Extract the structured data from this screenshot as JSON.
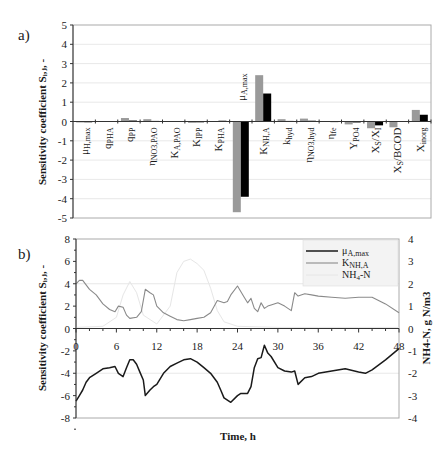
{
  "figure": {
    "panels": [
      "a)",
      "b)"
    ]
  },
  "colors": {
    "gray_bar": "#9a9a9a",
    "black_bar": "#000000",
    "mu_line": "#1a1a1a",
    "k_line": "#8a8a8a",
    "nh4_line": "#e6e6e6",
    "grid": "#d9d9d9",
    "axis": "#333333"
  },
  "chart_data": [
    {
      "type": "bar",
      "panel": "a)",
      "title": "",
      "xlabel": "",
      "ylabel": "Sensitivity coefficient Sᵢ,ⱼ, -",
      "ylim": [
        -5,
        5
      ],
      "yticks": [
        5,
        4,
        3,
        2,
        1,
        0,
        -1,
        -2,
        -3,
        -4,
        -5
      ],
      "grid": true,
      "legend": null,
      "categories": [
        "μH,max",
        "qPHA",
        "qPP",
        "ηNO3,PAO",
        "KA,PAO",
        "KIPP",
        "KPHA",
        "μA,max",
        "KNH,A",
        "khyd",
        "ηNO3,hyd",
        "ηfe",
        "YPO4",
        "XS/XI",
        "XS/BCOD",
        "Xinorg"
      ],
      "series": [
        {
          "name": "gray",
          "values": [
            -0.05,
            0.0,
            0.18,
            0.12,
            0.0,
            -0.07,
            0.0,
            -4.7,
            2.4,
            0.12,
            0.15,
            0.02,
            -0.15,
            -0.35,
            -0.3,
            0.6
          ]
        },
        {
          "name": "black",
          "values": [
            -0.02,
            0.0,
            0.05,
            0.03,
            0.0,
            -0.03,
            0.04,
            -3.9,
            1.45,
            0.03,
            0.04,
            0.01,
            -0.05,
            -0.2,
            0.0,
            0.35
          ]
        }
      ]
    },
    {
      "type": "line",
      "panel": "b)",
      "title": "",
      "xlabel": "Time, h",
      "ylabel": "Sensitivity coefficient Sᵢ,ⱼ, -",
      "y2label": "NH4-N, g N/m3",
      "xlim": [
        0,
        48
      ],
      "ylim": [
        -8,
        8
      ],
      "y2lim": [
        -4,
        4
      ],
      "xticks": [
        0,
        6,
        12,
        18,
        24,
        30,
        36,
        42,
        48
      ],
      "yticks": [
        8,
        6,
        4,
        2,
        0,
        -2,
        -4,
        -6,
        -8
      ],
      "y2ticks": [
        4,
        3,
        2,
        1,
        0,
        -1,
        -2,
        -3,
        -4
      ],
      "grid": true,
      "legend_position": "upper right",
      "series": [
        {
          "name": "μA,max",
          "axis": "left",
          "x": [
            0,
            0.5,
            1,
            1.5,
            2,
            3,
            4,
            5,
            5.8,
            6.3,
            7,
            7.5,
            8,
            8.5,
            9,
            9.5,
            10,
            10.3,
            11,
            11.5,
            12,
            13,
            14,
            15,
            16,
            17,
            18,
            19,
            20,
            21,
            21.5,
            22,
            23,
            24,
            24.5,
            25,
            25.5,
            26,
            26.5,
            27,
            27.5,
            28,
            28.5,
            29,
            30,
            31,
            32,
            32.5,
            33,
            34,
            35,
            36,
            38,
            40,
            42,
            43,
            44,
            46,
            48
          ],
          "y": [
            -6.5,
            -6.0,
            -5.5,
            -4.8,
            -4.4,
            -4.0,
            -3.6,
            -3.5,
            -3.4,
            -4.0,
            -4.3,
            -3.5,
            -2.8,
            -2.8,
            -3.2,
            -3.9,
            -4.6,
            -6.0,
            -5.5,
            -5.2,
            -5.0,
            -4.0,
            -3.4,
            -3.1,
            -2.8,
            -2.7,
            -3.0,
            -3.5,
            -4.0,
            -4.8,
            -5.5,
            -6.2,
            -6.6,
            -6.0,
            -5.8,
            -5.8,
            -5.8,
            -5.2,
            -3.5,
            -2.7,
            -2.6,
            -1.5,
            -2.2,
            -2.5,
            -3.5,
            -3.8,
            -3.9,
            -3.8,
            -5.0,
            -4.4,
            -4.3,
            -4.0,
            -3.8,
            -3.6,
            -3.9,
            -4.0,
            -3.7,
            -2.8,
            -1.8
          ]
        },
        {
          "name": "KNH,A",
          "axis": "left",
          "x": [
            0,
            0.5,
            1,
            2,
            3,
            4,
            5,
            5.8,
            6.3,
            7,
            7.5,
            8,
            9,
            9.7,
            10.3,
            11,
            11.5,
            12,
            13,
            14,
            15,
            16,
            17,
            18,
            19,
            20,
            21,
            22,
            22.5,
            23,
            24,
            25,
            25.5,
            26,
            26.5,
            27,
            27.5,
            28,
            28.5,
            29,
            30,
            31,
            32,
            32.5,
            33,
            34,
            35,
            36,
            38,
            40,
            42,
            44,
            46,
            48
          ],
          "y": [
            4.0,
            4.3,
            4.3,
            3.5,
            3.0,
            2.2,
            1.7,
            1.5,
            2.0,
            1.9,
            1.2,
            0.9,
            1.0,
            1.5,
            3.5,
            3.2,
            3.0,
            2.0,
            1.4,
            1.1,
            0.8,
            0.7,
            0.8,
            0.9,
            1.0,
            1.4,
            2.5,
            2.3,
            2.4,
            3.0,
            3.8,
            2.8,
            2.3,
            2.7,
            1.8,
            1.5,
            2.3,
            1.8,
            2.0,
            2.1,
            2.3,
            2.0,
            1.6,
            3.2,
            2.9,
            3.1,
            3.0,
            2.9,
            2.8,
            2.7,
            2.8,
            2.8,
            2.2,
            1.4
          ]
        },
        {
          "name": "NH4-N",
          "axis": "right",
          "x": [
            0,
            4,
            6,
            7,
            8,
            9,
            10,
            12,
            14,
            15,
            16,
            17,
            18,
            19,
            20,
            21,
            22,
            24,
            30,
            36,
            42,
            48
          ],
          "y": [
            0.05,
            0.1,
            0.5,
            1.5,
            2.1,
            1.6,
            0.6,
            0.2,
            1.0,
            2.5,
            3.0,
            3.1,
            2.9,
            2.6,
            1.8,
            0.8,
            0.3,
            0.1,
            0.05,
            0.05,
            0.05,
            0.05
          ]
        }
      ]
    }
  ]
}
